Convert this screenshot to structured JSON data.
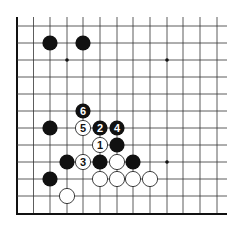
{
  "diagram": {
    "colors": {
      "background": "#ffffff",
      "line": "#333333",
      "edge": "#111111",
      "black_stone": "#111111",
      "white_stone": "#ffffff"
    },
    "grid": {
      "columns_x": [
        17,
        33.5,
        50,
        67,
        83,
        100,
        117,
        133,
        150,
        167,
        183,
        200,
        217
      ],
      "rows_y": [
        26,
        43,
        60,
        77,
        94,
        111,
        128,
        145,
        162,
        179,
        196
      ],
      "right_end_x": 227,
      "top_end_y": 17,
      "left_edge_x": 17,
      "bottom_edge_y": 214,
      "stone_radius": 7.6
    },
    "star_points": [
      {
        "col": 3,
        "row": 2
      },
      {
        "col": 9,
        "row": 2
      },
      {
        "col": 9,
        "row": 8
      }
    ],
    "stones": [
      {
        "color": "black",
        "col": 2,
        "row": 1,
        "label": ""
      },
      {
        "color": "black",
        "col": 4,
        "row": 1,
        "label": ""
      },
      {
        "color": "black",
        "col": 4,
        "row": 5,
        "label": "6"
      },
      {
        "color": "black",
        "col": 2,
        "row": 6,
        "label": ""
      },
      {
        "color": "white",
        "col": 4,
        "row": 6,
        "label": "5"
      },
      {
        "color": "black",
        "col": 5,
        "row": 6,
        "label": "2"
      },
      {
        "color": "black",
        "col": 6,
        "row": 6,
        "label": "4"
      },
      {
        "color": "white",
        "col": 5,
        "row": 7,
        "label": "1"
      },
      {
        "color": "black",
        "col": 6,
        "row": 7,
        "label": ""
      },
      {
        "color": "black",
        "col": 3,
        "row": 8,
        "label": ""
      },
      {
        "color": "white",
        "col": 4,
        "row": 8,
        "label": "3"
      },
      {
        "color": "black",
        "col": 5,
        "row": 8,
        "label": ""
      },
      {
        "color": "white",
        "col": 6,
        "row": 8,
        "label": ""
      },
      {
        "color": "black",
        "col": 7,
        "row": 8,
        "label": ""
      },
      {
        "color": "black",
        "col": 2,
        "row": 9,
        "label": ""
      },
      {
        "color": "white",
        "col": 5,
        "row": 9,
        "label": ""
      },
      {
        "color": "white",
        "col": 6,
        "row": 9,
        "label": ""
      },
      {
        "color": "white",
        "col": 7,
        "row": 9,
        "label": ""
      },
      {
        "color": "white",
        "col": 8,
        "row": 9,
        "label": ""
      },
      {
        "color": "white",
        "col": 3,
        "row": 10,
        "label": ""
      }
    ]
  }
}
